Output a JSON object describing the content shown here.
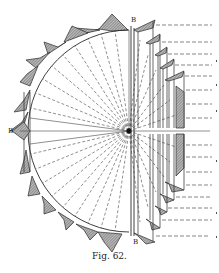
{
  "figure": {
    "caption": "Fig. 62.",
    "labels": {
      "top": "B",
      "left": "B",
      "bottom": "B"
    },
    "colors": {
      "ink": "#2a2a2a",
      "shade": "#8a8a8a",
      "paper": "#ffffff"
    }
  }
}
